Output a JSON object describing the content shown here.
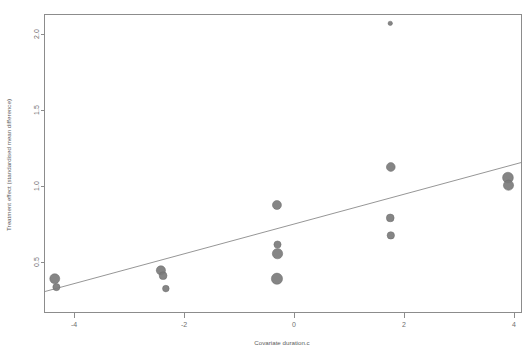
{
  "chart_data": {
    "type": "scatter",
    "title": "",
    "subtitle": "",
    "xlabel": "Covariate duration.c",
    "ylabel": "Treatment effect (standardised mean difference)",
    "xlim": [
      -4.9,
      4.25
    ],
    "ylim": [
      0.25,
      2.2
    ],
    "xticks": [
      -4,
      -2,
      0,
      2,
      4
    ],
    "xticklabels": [
      "-4",
      "-2",
      "0",
      "2",
      "4"
    ],
    "yticks": [
      0.5,
      1.0,
      1.5,
      2.0
    ],
    "yticklabels": [
      "0.5",
      "1.0",
      "1.5",
      "2.0"
    ],
    "grid": false,
    "legend": null,
    "legend_position": "none",
    "marker_color": "#7b7b7b",
    "line_color": "#8a8a8a",
    "axis_color": "#8c8c8c",
    "bubble_size_meaning": "study weight (inverse variance)",
    "points": [
      {
        "x": -4.35,
        "y": 0.39,
        "size": 5.0
      },
      {
        "x": -4.32,
        "y": 0.335,
        "size": 3.6
      },
      {
        "x": -2.42,
        "y": 0.445,
        "size": 4.6
      },
      {
        "x": -2.38,
        "y": 0.41,
        "size": 3.9
      },
      {
        "x": -2.33,
        "y": 0.325,
        "size": 3.3
      },
      {
        "x": -0.31,
        "y": 0.875,
        "size": 4.5
      },
      {
        "x": -0.3,
        "y": 0.615,
        "size": 3.6
      },
      {
        "x": -0.3,
        "y": 0.555,
        "size": 5.2
      },
      {
        "x": -0.31,
        "y": 0.39,
        "size": 5.6
      },
      {
        "x": 1.75,
        "y": 2.07,
        "size": 2.2
      },
      {
        "x": 1.76,
        "y": 1.125,
        "size": 4.4
      },
      {
        "x": 1.75,
        "y": 0.79,
        "size": 3.9
      },
      {
        "x": 1.76,
        "y": 0.675,
        "size": 3.7
      },
      {
        "x": 3.89,
        "y": 1.055,
        "size": 5.4
      },
      {
        "x": 3.9,
        "y": 1.005,
        "size": 5.1
      }
    ],
    "regression_line": {
      "x1": -4.9,
      "y1": 0.305,
      "x2": 4.25,
      "y2": 1.155
    }
  }
}
